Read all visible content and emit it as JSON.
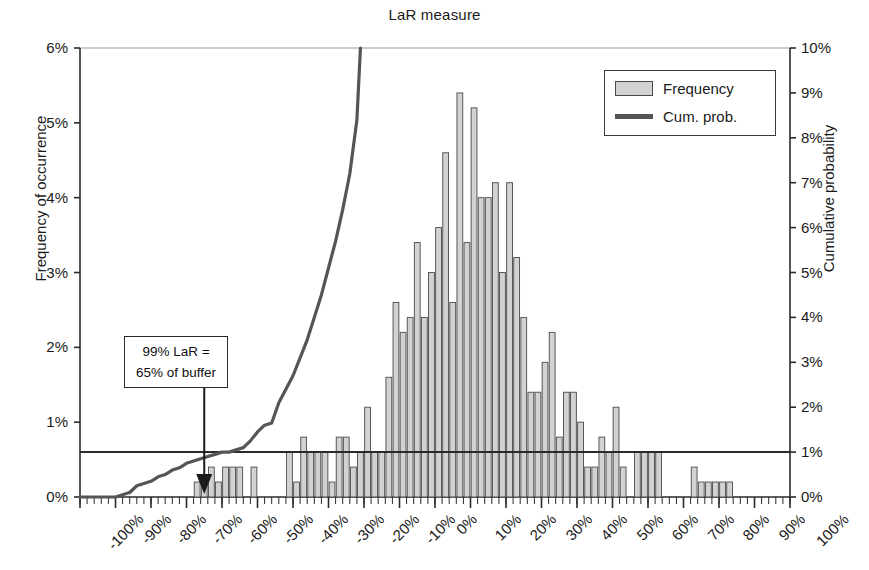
{
  "chart_data": {
    "type": "bar",
    "title": "LaR measure",
    "xlabel": "",
    "ylabel": "Frequency of occurrence",
    "y2label": "Cumulative probability",
    "grid": false,
    "legend_position": "top-right",
    "xlim": [
      -100,
      100
    ],
    "ylim": [
      0,
      6
    ],
    "y2lim": [
      0,
      10
    ],
    "xtick_labels": [
      "-100%",
      "-90%",
      "-80%",
      "-70%",
      "-60%",
      "-50%",
      "-40%",
      "-30%",
      "-20%",
      "-10%",
      "0%",
      "10%",
      "20%",
      "30%",
      "40%",
      "50%",
      "60%",
      "70%",
      "80%",
      "90%",
      "100%"
    ],
    "xtick_values": [
      -100,
      -90,
      -80,
      -70,
      -60,
      -50,
      -40,
      -30,
      -20,
      -10,
      0,
      10,
      20,
      30,
      40,
      50,
      60,
      70,
      80,
      90,
      100
    ],
    "ytick_labels": [
      "0%",
      "1%",
      "2%",
      "3%",
      "4%",
      "5%",
      "6%"
    ],
    "ytick_values": [
      0,
      1,
      2,
      3,
      4,
      5,
      6
    ],
    "y2tick_labels": [
      "0%",
      "1%",
      "2%",
      "3%",
      "4%",
      "5%",
      "6%",
      "7%",
      "8%",
      "9%",
      "10%"
    ],
    "y2tick_values": [
      0,
      1,
      2,
      3,
      4,
      5,
      6,
      7,
      8,
      9,
      10
    ],
    "bin_width": 2,
    "bin_centers": [
      -99,
      -97,
      -95,
      -93,
      -91,
      -89,
      -87,
      -85,
      -83,
      -81,
      -79,
      -77,
      -75,
      -73,
      -71,
      -69,
      -67,
      -65,
      -63,
      -61,
      -59,
      -57,
      -55,
      -53,
      -51,
      -49,
      -47,
      -45,
      -43,
      -41,
      -39,
      -37,
      -35,
      -33,
      -31,
      -29,
      -27,
      -25,
      -23,
      -21,
      -19,
      -17,
      -15,
      -13,
      -11,
      -9,
      -7,
      -5,
      -3,
      -1,
      1,
      3,
      5,
      7,
      9,
      11,
      13,
      15,
      17,
      19,
      21,
      23,
      25,
      27,
      29,
      31,
      33,
      35,
      37,
      39,
      41,
      43,
      45,
      47,
      49,
      51,
      53,
      55,
      57,
      59,
      61,
      63,
      65,
      67,
      69,
      71,
      73,
      75,
      77,
      79,
      81,
      83,
      85,
      87,
      89,
      91,
      93,
      95,
      97,
      99
    ],
    "series": [
      {
        "name": "Frequency",
        "axis": "left",
        "color": "#d2d2d2",
        "edge_color": "#4a4a4a",
        "values": [
          0,
          0,
          0,
          0,
          0,
          0,
          0,
          0,
          0,
          0,
          0,
          0,
          0,
          0,
          0,
          0,
          0.2,
          0.2,
          0.4,
          0.2,
          0.4,
          0.4,
          0.4,
          0,
          0.4,
          0,
          0,
          0,
          0,
          0.6,
          0.2,
          0.8,
          0.6,
          0.6,
          0.6,
          0.2,
          0.8,
          0.8,
          0.4,
          0.6,
          1.2,
          0.6,
          0.6,
          1.6,
          2.6,
          2.2,
          2.4,
          3.4,
          2.4,
          3.0,
          3.6,
          4.6,
          2.6,
          5.4,
          3.4,
          5.2,
          4.0,
          4.0,
          4.2,
          3.0,
          4.2,
          3.2,
          2.4,
          1.4,
          1.4,
          1.8,
          2.2,
          0.8,
          1.4,
          1.4,
          1.0,
          0.4,
          0.4,
          0.8,
          0.6,
          1.2,
          0.4,
          0,
          0.6,
          0.6,
          0.6,
          0.6,
          0,
          0,
          0,
          0,
          0.4,
          0.2,
          0.2,
          0.2,
          0.2,
          0.2,
          0,
          0,
          0,
          0,
          0,
          0
        ]
      },
      {
        "name": "Cum. prob.",
        "axis": "right",
        "color": "#555555",
        "type": "line",
        "x": [
          -100,
          -90,
          -86,
          -84,
          -82,
          -80,
          -78,
          -76,
          -74,
          -72,
          -70,
          -68,
          -66,
          -64,
          -62,
          -60,
          -58,
          -56,
          -54,
          -52,
          -50,
          -48,
          -46,
          -44,
          -42,
          -40,
          -38,
          -36,
          -34,
          -32,
          -30,
          -28,
          -26,
          -24,
          -22,
          -21
        ],
        "values": [
          0,
          0,
          0.1,
          0.25,
          0.3,
          0.35,
          0.45,
          0.5,
          0.6,
          0.65,
          0.75,
          0.8,
          0.85,
          0.9,
          0.95,
          1.0,
          1.0,
          1.05,
          1.1,
          1.25,
          1.45,
          1.6,
          1.65,
          2.1,
          2.4,
          2.7,
          3.1,
          3.5,
          4.0,
          4.5,
          5.1,
          5.7,
          6.4,
          7.2,
          8.4,
          10.0
        ]
      }
    ],
    "threshold_line": {
      "name": "one-percent-line",
      "y2_value": 1,
      "color": "#2a2a2a"
    },
    "annotation": {
      "line1": "99% LaR =",
      "line2": "65% of buffer",
      "pointer_x": -65,
      "arrow_color": "#1a1a1a"
    },
    "legend": {
      "items": [
        {
          "label": "Frequency",
          "kind": "bar"
        },
        {
          "label": "Cum. prob.",
          "kind": "line"
        }
      ]
    }
  }
}
